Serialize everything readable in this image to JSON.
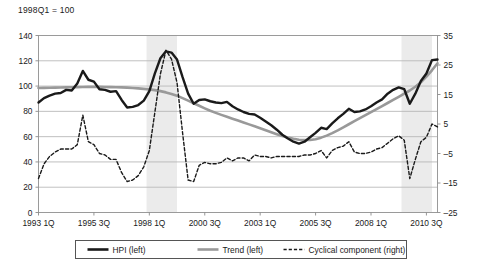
{
  "chart_data": {
    "type": "line",
    "title": "1998Q1 = 100",
    "xlabel": "",
    "ylabel": "",
    "grid": true,
    "legend_position": "bottom",
    "axes": {
      "left": {
        "label": "",
        "ylim": [
          0,
          140
        ],
        "ticks": [
          "0",
          "20",
          "40",
          "60",
          "80",
          "100",
          "120",
          "140"
        ],
        "tick_values": [
          0,
          20,
          40,
          60,
          80,
          100,
          120,
          140
        ]
      },
      "right": {
        "label": "",
        "ylim": [
          -25,
          35
        ],
        "ticks": [
          "-25",
          "-15",
          "-5",
          "5",
          "15",
          "25",
          "35"
        ],
        "tick_values": [
          -25,
          -15,
          -5,
          5,
          15,
          25,
          35
        ]
      },
      "x": {
        "ticks": [
          "1993 1Q",
          "1995 3Q",
          "1998 1Q",
          "2000 3Q",
          "2003 1Q",
          "2005 3Q",
          "2008 1Q",
          "2010 3Q"
        ],
        "tick_index": [
          0,
          10,
          20,
          30,
          40,
          50,
          60,
          70
        ],
        "n_points": 73
      }
    },
    "shaded_bands": [
      {
        "start_index": 19.5,
        "end_index": 25.0,
        "color": "#ebebeb"
      },
      {
        "start_index": 65.5,
        "end_index": 71.0,
        "color": "#ebebeb"
      }
    ],
    "series": [
      {
        "name": "HPI (left)",
        "axis": "left",
        "style": "solid",
        "color": "#1a1a1a",
        "width": 2.4,
        "values": [
          87,
          90.5,
          92.5,
          94,
          94.5,
          97,
          96.5,
          102,
          112,
          105,
          103.5,
          97.5,
          97,
          95.5,
          96,
          89,
          83,
          83.5,
          85,
          88.5,
          96,
          110,
          122,
          127.5,
          126.5,
          121,
          107,
          94,
          86,
          89,
          89.5,
          88,
          87,
          86.5,
          87.5,
          84,
          81.5,
          79.5,
          78,
          77.5,
          75,
          72,
          69,
          65.5,
          61.5,
          58.5,
          56,
          54.5,
          56,
          59.5,
          63,
          67,
          66,
          70.5,
          74.5,
          78,
          82,
          79.5,
          80,
          81.5,
          84,
          87,
          89.5,
          94,
          97,
          99,
          97.5,
          86,
          94,
          104,
          110,
          120.5,
          121
        ]
      },
      {
        "name": "Trend (left)",
        "axis": "left",
        "style": "solid",
        "color": "#999999",
        "width": 2.6,
        "values": [
          98.5,
          98.6,
          98.7,
          98.8,
          98.9,
          99,
          99.1,
          99.2,
          99.3,
          99.4,
          99.4,
          99.4,
          99.3,
          99.2,
          99.1,
          99,
          98.8,
          98.5,
          98.2,
          97.8,
          97.4,
          96.8,
          96,
          95,
          93.8,
          92.3,
          90.5,
          88.5,
          86.4,
          84.4,
          82.4,
          80.5,
          78.8,
          77.2,
          75.7,
          74.2,
          72.7,
          71.2,
          69.7,
          68.2,
          66.6,
          65,
          63.4,
          61.9,
          60.5,
          59.3,
          58.3,
          57.6,
          57.3,
          57.4,
          58,
          59.2,
          60.8,
          62.8,
          65,
          67.4,
          69.8,
          72.2,
          74.6,
          77,
          79.4,
          81.8,
          84.2,
          86.6,
          89,
          91.5,
          94,
          96.5,
          99.5,
          103,
          107.5,
          112.5,
          118
        ]
      },
      {
        "name": "Cyclical component (right)",
        "axis": "right",
        "style": "dashed",
        "color": "#1a1a1a",
        "width": 1.4,
        "values": [
          -13.5,
          -8.5,
          -6,
          -4.5,
          -3.5,
          -3.5,
          -3.5,
          -2,
          8,
          -1,
          -2,
          -5,
          -5.5,
          -7,
          -7,
          -11.5,
          -14.5,
          -14,
          -12.5,
          -9.5,
          -4,
          9,
          22,
          30,
          27,
          19,
          2,
          -14,
          -14.5,
          -9,
          -8,
          -8.5,
          -8.5,
          -8,
          -6.5,
          -7.5,
          -6.5,
          -6.5,
          -7.5,
          -5.5,
          -6,
          -6,
          -6.5,
          -6,
          -6,
          -6,
          -6,
          -6,
          -5.5,
          -5.5,
          -5,
          -4,
          -6.5,
          -4,
          -3,
          -2.5,
          -1,
          -4.5,
          -5,
          -5,
          -4.5,
          -3.5,
          -3,
          -1.5,
          0,
          1,
          -0.5,
          -13.5,
          -7,
          -1,
          0.5,
          5,
          4
        ]
      }
    ]
  },
  "legend": {
    "items": [
      {
        "label": "HPI (left)",
        "style": "solid",
        "color": "#1a1a1a",
        "width": 2.6
      },
      {
        "label": "Trend (left)",
        "style": "solid",
        "color": "#999999",
        "width": 2.6
      },
      {
        "label": "Cyclical component (right)",
        "style": "dashed",
        "color": "#1a1a1a",
        "width": 1.4
      }
    ]
  }
}
